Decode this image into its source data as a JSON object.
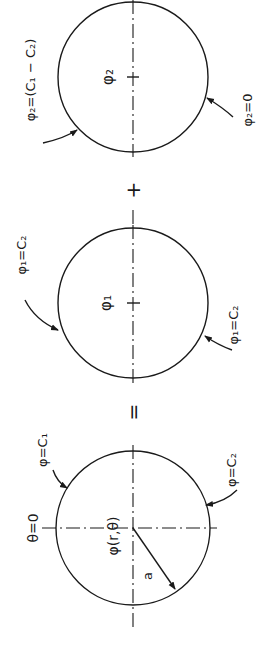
{
  "figure": {
    "colors": {
      "ink": "#1a1a1a",
      "background": "#ffffff"
    },
    "operators": {
      "equals": "=",
      "plus": "+"
    },
    "panel_original": {
      "center_label": "φ(r,θ)",
      "angle_label": "θ=0",
      "upper_boundary_label": "φ=C₁",
      "lower_boundary_label": "φ=C₂",
      "radius_label": "a"
    },
    "panel_phi1": {
      "center_label": "φ₁",
      "upper_boundary_label": "φ₁=C₂",
      "lower_boundary_label": "φ₁=C₂"
    },
    "panel_phi2": {
      "center_label": "φ₂",
      "upper_boundary_label": "φ₂=(C₁ − C₂)",
      "lower_boundary_label": "φ₂=0"
    }
  }
}
